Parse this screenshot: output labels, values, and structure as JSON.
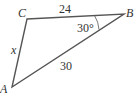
{
  "figure": {
    "type": "triangle",
    "vertices": {
      "A": {
        "label": "A"
      },
      "B": {
        "label": "B"
      },
      "C": {
        "label": "C"
      }
    },
    "sides": {
      "CB": {
        "label": "24"
      },
      "CA": {
        "label": "x"
      },
      "AB": {
        "label": "30"
      }
    },
    "angles": {
      "B": {
        "label": "30°"
      }
    },
    "colors": {
      "stroke": "#555555",
      "text": "#333333"
    }
  }
}
